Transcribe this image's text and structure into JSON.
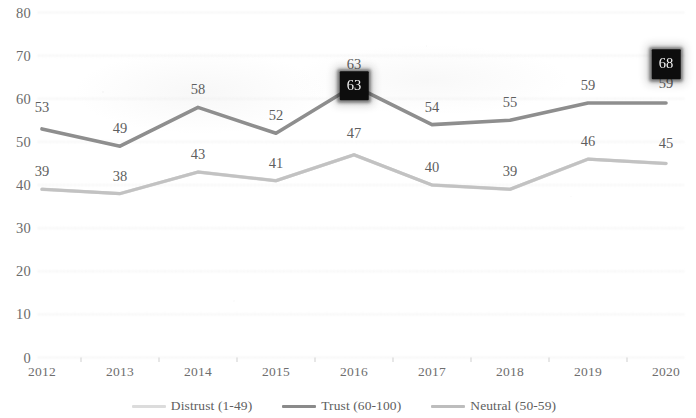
{
  "chart_data": {
    "type": "line",
    "title": "",
    "subtitle": "",
    "xlabel": "",
    "ylabel": "",
    "x": [
      "2012",
      "2013",
      "2014",
      "2015",
      "2016",
      "2017",
      "2018",
      "2019",
      "2020"
    ],
    "categories": [
      "2012",
      "2013",
      "2014",
      "2015",
      "2016",
      "2017",
      "2018",
      "2019",
      "2020"
    ],
    "ylim": [
      0,
      80
    ],
    "y_ticks": [
      0,
      10,
      20,
      30,
      40,
      50,
      60,
      70,
      80
    ],
    "y_tick_labels": [
      "0",
      "10",
      "20",
      "30",
      "40",
      "50",
      "60",
      "70",
      "80"
    ],
    "grid": true,
    "grid_axis": "y",
    "legend_position": "bottom",
    "series": [
      {
        "name": "Distrust (1-49)",
        "color": "#d8d8d8",
        "values": [
          39,
          38,
          43,
          41,
          47,
          40,
          39,
          46,
          45
        ],
        "labels": [
          "39",
          "38",
          "43",
          "41",
          "47",
          "40",
          "39",
          "46",
          "45"
        ]
      },
      {
        "name": "Trust (60-100)",
        "color": "#8e8e8e",
        "values": [
          53,
          49,
          58,
          52,
          63,
          54,
          55,
          59,
          59
        ],
        "labels": [
          "53",
          "49",
          "58",
          "52",
          "63",
          "54",
          "55",
          "59",
          "59"
        ]
      },
      {
        "name": "Neutral (50-59)",
        "color": "#c2c2c2",
        "values": [
          39,
          38,
          43,
          41,
          47,
          40,
          39,
          46,
          45
        ],
        "labels": []
      }
    ],
    "annotations": [
      {
        "text": "63",
        "x": "2016",
        "y": 63,
        "style": "black-highlight-box"
      },
      {
        "text": "68",
        "x": "2020",
        "y": 68,
        "style": "black-highlight-box"
      }
    ]
  },
  "legend": {
    "items": [
      {
        "label": "Distrust (1-49)",
        "color": "#dcdcdc"
      },
      {
        "label": "Trust (60-100)",
        "color": "#8a8a8a"
      },
      {
        "label": "Neutral (50-59)",
        "color": "#bdbdbd"
      }
    ]
  },
  "axis": {
    "y_labels": [
      "80",
      "70",
      "60",
      "50",
      "40",
      "30",
      "20",
      "10",
      "0"
    ],
    "x_labels": [
      "2012",
      "2013",
      "2014",
      "2015",
      "2016",
      "2017",
      "2018",
      "2019",
      "2020"
    ]
  },
  "data_labels": {
    "upper": [
      "53",
      "49",
      "58",
      "52",
      "63",
      "54",
      "55",
      "59",
      "59"
    ],
    "lower": [
      "39",
      "38",
      "43",
      "41",
      "47",
      "40",
      "39",
      "46",
      "45"
    ]
  },
  "highlights": {
    "box_2016": "63",
    "box_2020": "68"
  },
  "colors": {
    "trust_line": "#8e8e8e",
    "neutral_line": "#c2c2c2",
    "distrust_line": "#dcdcdc",
    "gridline": "#e0e0e0",
    "highlight_box_bg": "#0d0d0d",
    "highlight_box_text": "#f2f2f2",
    "text": "#5f5f5f"
  }
}
